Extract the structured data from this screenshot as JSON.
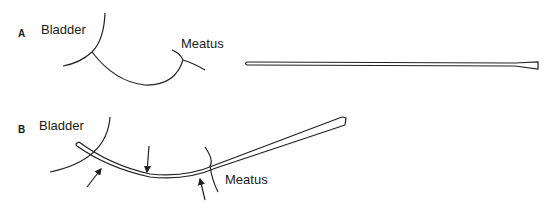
{
  "panels": [
    {
      "id": "A",
      "label": "A",
      "bladder_label": "Bladder",
      "meatus_label": "Meatus"
    },
    {
      "id": "B",
      "label": "B",
      "bladder_label": "Bladder",
      "meatus_label": "Meatus"
    }
  ],
  "colors": {
    "line": "#222222",
    "background": "#ffffff"
  }
}
